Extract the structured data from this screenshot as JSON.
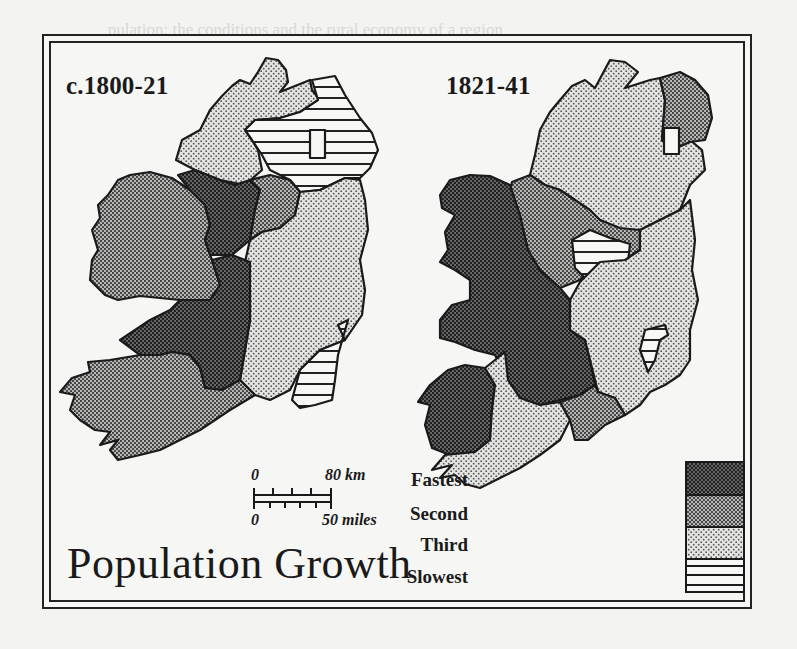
{
  "figure": {
    "title": "Population Growth",
    "maps": [
      {
        "label": "c.1800-21",
        "regions": [
          {
            "name": "Ulster (west)",
            "category": "Third"
          },
          {
            "name": "Ulster (east)",
            "category": "Slowest"
          },
          {
            "name": "Connacht (west)",
            "category": "Second"
          },
          {
            "name": "Connacht (east)",
            "category": "Fastest"
          },
          {
            "name": "Leinster",
            "category": "Third"
          },
          {
            "name": "Wexford/South-east",
            "category": "Slowest"
          },
          {
            "name": "Munster (north)",
            "category": "Fastest"
          },
          {
            "name": "Munster (south-west)",
            "category": "Second"
          }
        ]
      },
      {
        "label": "1821-41",
        "regions": [
          {
            "name": "Ulster (north)",
            "category": "Third"
          },
          {
            "name": "Antrim/Down",
            "category": "Second"
          },
          {
            "name": "Connacht",
            "category": "Fastest"
          },
          {
            "name": "North midlands",
            "category": "Second"
          },
          {
            "name": "Central midlands",
            "category": "Slowest"
          },
          {
            "name": "Leinster",
            "category": "Third"
          },
          {
            "name": "Wicklow area",
            "category": "Slowest"
          },
          {
            "name": "Clare/Kerry",
            "category": "Fastest"
          },
          {
            "name": "Munster (south)",
            "category": "Third"
          },
          {
            "name": "Tipperary (south)",
            "category": "Second"
          }
        ]
      }
    ],
    "scale": {
      "km_start": "0",
      "km_end": "80 km",
      "mi_start": "0",
      "mi_end": "50 miles"
    },
    "legend": {
      "items": [
        {
          "label": "Fastest",
          "pattern": "dense-dots-dark",
          "color": "#3a3a3a"
        },
        {
          "label": "Second",
          "pattern": "medium-dots",
          "color": "#777777"
        },
        {
          "label": "Third",
          "pattern": "light-dots",
          "color": "#b5b5b5"
        },
        {
          "label": "Slowest",
          "pattern": "horizontal-lines",
          "color": "#ffffff"
        }
      ]
    }
  },
  "background_text": [
    "                                                              ",
    "   pulation: the conditions and the rural economy of a region",
    "  suited to it: they  were, however,  improvements, probably",
    "  on old-established lines,   but,   mostly  pressure  which  in",
    "  the  eighteenth  century,    is   still   largely  unknown",
    "  while  the  most  significant  instance  of  the  doctrine  of",
    "  the Ulster  custom:  keep  the  farm  in  the  family  name",
    "  such  tenants  or  undertenants were  already  being  recorded",
    "  in  the  1840s,  when  the  subsequent  attempted  to  repeated",
    "  as  a  dramatic  instance  of  a  growing  population",
    "  in  many  districts,   already  before  1800,   a  population",
    "  the  balance  of  life  could  be  set  by  the  average  plenty",
    "  subdivision  of  the  holdings  became  a  regular  practice",
    "  the  decades  following,  more  and  more  people  were",
    "  tenants  holding  little  or  nothing  in  the  way  of  land",
    "  other  taxes  and  the  conacre  system  which",
    "  and  the  most  intensive  forms  of  tillage,  as  the",
    "  standard  crop  of  the  poor,  the  potato",
    "  and  the  lack  of  a  government  famine  relief  and  rising",
    "  population  and  pressure  on  the  land",
    "  the  potato  economy  was  vulnerable"
  ]
}
